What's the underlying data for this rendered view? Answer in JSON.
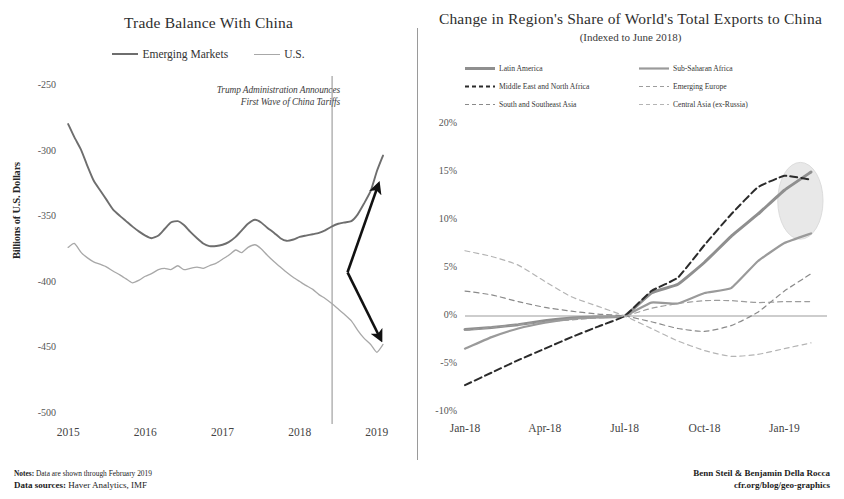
{
  "left": {
    "title": "Trade Balance With China",
    "ylabel": "Billions of U.S. Dollars",
    "annotation_line1": "Trump Administration Announces",
    "annotation_line2": "First Wave of China Tariffs",
    "legend": [
      {
        "label": "Emerging Markets",
        "color": "#6e6e6e",
        "width": 2.1
      },
      {
        "label": "U.S.",
        "color": "#a8a8a8",
        "width": 1.4
      }
    ]
  },
  "right": {
    "title": "Change in Region's Share of World's Total Exports to China",
    "subtitle": "(Indexed to June 2018)",
    "legend": [
      {
        "label": "Latin America",
        "color": "#8f8f8f",
        "dash": "solid",
        "width": 3
      },
      {
        "label": "Sub-Saharan Africa",
        "color": "#9a9a9a",
        "dash": "solid",
        "width": 2.2
      },
      {
        "label": "Middle East and North Africa",
        "color": "#2b2b2b",
        "dash": "dashed",
        "width": 2
      },
      {
        "label": "Emerging Europe",
        "color": "#9d9d9d",
        "dash": "dashed",
        "width": 1.2
      },
      {
        "label": "South and Southeast Asia",
        "color": "#8a8a8a",
        "dash": "dashed",
        "width": 1.2
      },
      {
        "label": "Central Asia (ex-Russia)",
        "color": "#b4b4b4",
        "dash": "dashed",
        "width": 1.2
      }
    ]
  },
  "footer": {
    "notes_label": "Notes:",
    "notes_text": " Data are shown through February 2019",
    "sources_label": "Data sources:",
    "sources_text": " Haver Analytics, IMF",
    "authors": "Benn Steil & Benjamin Della Rocca",
    "url": "cfr.org/blog/geo-graphics"
  },
  "chart_data": [
    {
      "type": "line",
      "title": "Trade Balance With China",
      "xlabel": "",
      "ylabel": "Billions of U.S. Dollars",
      "ylim": [
        -500,
        -250
      ],
      "yticks": [
        -250,
        -300,
        -350,
        -400,
        -450,
        -500
      ],
      "ytick_labels": [
        "-250",
        "-300",
        "-350",
        "-400",
        "-450",
        "-500"
      ],
      "xticks": [
        2015,
        2016,
        2017,
        2018,
        2019
      ],
      "xtick_labels": [
        "2015",
        "2016",
        "2017",
        "2018",
        "2019"
      ],
      "xlim": [
        2014.92,
        2019.3
      ],
      "grid": false,
      "legend_position": "top-center",
      "annotations": [
        {
          "text": "Trump Administration Announces First Wave of China Tariffs",
          "x": 2018.42,
          "type": "vline"
        },
        {
          "text": "divergence-arrow-up",
          "type": "arrow",
          "x0": 2018.62,
          "y0": -392,
          "x1": 2019.02,
          "y1": -325
        },
        {
          "text": "divergence-arrow-down",
          "type": "arrow",
          "x0": 2018.62,
          "y0": -392,
          "x1": 2019.05,
          "y1": -443
        }
      ],
      "series": [
        {
          "name": "Emerging Markets",
          "color": "#6e6e6e",
          "x": [
            2015.0,
            2015.08,
            2015.17,
            2015.25,
            2015.33,
            2015.42,
            2015.5,
            2015.58,
            2015.67,
            2015.75,
            2015.83,
            2015.92,
            2016.0,
            2016.08,
            2016.17,
            2016.25,
            2016.33,
            2016.42,
            2016.5,
            2016.58,
            2016.67,
            2016.75,
            2016.83,
            2016.92,
            2017.0,
            2017.08,
            2017.17,
            2017.25,
            2017.33,
            2017.42,
            2017.5,
            2017.58,
            2017.67,
            2017.75,
            2017.83,
            2017.92,
            2018.0,
            2018.08,
            2018.17,
            2018.25,
            2018.33,
            2018.42,
            2018.5,
            2018.58,
            2018.67,
            2018.75,
            2018.83,
            2018.92,
            2019.0,
            2019.08
          ],
          "y": [
            -279,
            -289,
            -299,
            -311,
            -322,
            -330,
            -337,
            -344,
            -349,
            -353,
            -357,
            -361,
            -364,
            -366,
            -364,
            -359,
            -354,
            -353,
            -356,
            -361,
            -366,
            -370,
            -372,
            -372,
            -371,
            -369,
            -365,
            -360,
            -355,
            -352,
            -354,
            -358,
            -362,
            -366,
            -368,
            -367,
            -365,
            -364,
            -363,
            -362,
            -360,
            -357,
            -355,
            -354,
            -353,
            -348,
            -340,
            -330,
            -315,
            -303
          ]
        },
        {
          "name": "U.S.",
          "color": "#a8a8a8",
          "x": [
            2015.0,
            2015.08,
            2015.17,
            2015.25,
            2015.33,
            2015.42,
            2015.5,
            2015.58,
            2015.67,
            2015.75,
            2015.83,
            2015.92,
            2016.0,
            2016.08,
            2016.17,
            2016.25,
            2016.33,
            2016.42,
            2016.5,
            2016.58,
            2016.67,
            2016.75,
            2016.83,
            2016.92,
            2017.0,
            2017.08,
            2017.17,
            2017.25,
            2017.33,
            2017.42,
            2017.5,
            2017.58,
            2017.67,
            2017.75,
            2017.83,
            2017.92,
            2018.0,
            2018.08,
            2018.17,
            2018.25,
            2018.33,
            2018.42,
            2018.5,
            2018.58,
            2018.67,
            2018.75,
            2018.83,
            2018.92,
            2019.0,
            2019.08
          ],
          "y": [
            -373,
            -370,
            -377,
            -381,
            -384,
            -386,
            -388,
            -391,
            -394,
            -397,
            -400,
            -398,
            -395,
            -393,
            -390,
            -389,
            -390,
            -387,
            -390,
            -389,
            -388,
            -389,
            -387,
            -385,
            -382,
            -379,
            -375,
            -377,
            -373,
            -371,
            -374,
            -379,
            -384,
            -388,
            -392,
            -396,
            -399,
            -402,
            -405,
            -409,
            -412,
            -416,
            -420,
            -424,
            -429,
            -436,
            -442,
            -447,
            -453,
            -447
          ]
        }
      ]
    },
    {
      "type": "line",
      "title": "Change in Region's Share of World's Total Exports to China",
      "subtitle": "(Indexed to June 2018)",
      "xlabel": "",
      "ylabel": "",
      "ylim": [
        -10,
        20
      ],
      "yticks": [
        20,
        15,
        10,
        5,
        0,
        -5,
        -10
      ],
      "ytick_labels": [
        "20%",
        "15%",
        "10%",
        "5%",
        "0%",
        "-5%",
        "-10%"
      ],
      "xtick_labels": [
        "Jan-18",
        "Apr-18",
        "Jul-18",
        "Oct-18",
        "Jan-19"
      ],
      "xticks": [
        0,
        3,
        6,
        9,
        12
      ],
      "xlim": [
        0,
        13.6
      ],
      "grid": false,
      "zero_line": true,
      "legend_position": "top",
      "annotations": [
        {
          "type": "ellipse-highlight",
          "cx": 12.6,
          "cy": 12.0,
          "rx": 0.85,
          "ry": 4.0,
          "color": "#e8e8e8"
        }
      ],
      "series": [
        {
          "name": "Latin America",
          "color": "#8f8f8f",
          "dash": "solid",
          "width": 3,
          "x": [
            0,
            1,
            2,
            3,
            4,
            5,
            6,
            7,
            8,
            9,
            10,
            11,
            12,
            13
          ],
          "y": [
            -1.4,
            -1.2,
            -0.9,
            -0.5,
            -0.2,
            -0.1,
            0,
            2.4,
            3.3,
            5.6,
            8.3,
            10.6,
            13.1,
            15.0
          ]
        },
        {
          "name": "Sub-Saharan Africa",
          "color": "#9a9a9a",
          "dash": "solid",
          "width": 2.2,
          "x": [
            0,
            1,
            2,
            3,
            4,
            5,
            6,
            7,
            8,
            9,
            10,
            11,
            12,
            13
          ],
          "y": [
            -3.4,
            -2.2,
            -1.3,
            -0.7,
            -0.3,
            -0.1,
            0,
            1.4,
            1.3,
            2.4,
            2.9,
            5.7,
            7.6,
            8.6
          ]
        },
        {
          "name": "Middle East and North Africa",
          "color": "#2b2b2b",
          "dash": "dashed",
          "width": 2,
          "x": [
            0,
            1,
            2,
            3,
            4,
            5,
            6,
            7,
            8,
            9,
            10,
            11,
            12,
            13
          ],
          "y": [
            -7.2,
            -5.9,
            -4.6,
            -3.4,
            -2.2,
            -1.1,
            0,
            2.6,
            4.0,
            7.4,
            10.6,
            13.4,
            14.6,
            14.2
          ]
        },
        {
          "name": "Emerging Europe",
          "color": "#9d9d9d",
          "dash": "dashed",
          "width": 1.2,
          "x": [
            0,
            1,
            2,
            3,
            4,
            5,
            6,
            7,
            8,
            9,
            10,
            11,
            12,
            13
          ],
          "y": [
            -1.5,
            -1.2,
            -0.9,
            -0.6,
            -0.4,
            -0.2,
            0,
            0.8,
            1.3,
            1.6,
            1.6,
            1.4,
            1.5,
            1.5
          ]
        },
        {
          "name": "South and Southeast Asia",
          "color": "#8a8a8a",
          "dash": "dashed",
          "width": 1.2,
          "x": [
            0,
            1,
            2,
            3,
            4,
            5,
            6,
            7,
            8,
            9,
            10,
            11,
            12,
            13
          ],
          "y": [
            2.6,
            2.2,
            1.5,
            0.9,
            0.5,
            0.2,
            0,
            -0.6,
            -1.3,
            -1.6,
            -1.0,
            0.4,
            2.6,
            4.4
          ]
        },
        {
          "name": "Central Asia (ex-Russia)",
          "color": "#b4b4b4",
          "dash": "dashed",
          "width": 1.2,
          "x": [
            0,
            1,
            2,
            3,
            4,
            5,
            6,
            7,
            8,
            9,
            10,
            11,
            12,
            13
          ],
          "y": [
            6.8,
            6.2,
            5.3,
            3.6,
            2.0,
            1.0,
            0,
            -1.3,
            -2.6,
            -3.6,
            -4.2,
            -4.0,
            -3.4,
            -2.8
          ]
        }
      ]
    }
  ]
}
